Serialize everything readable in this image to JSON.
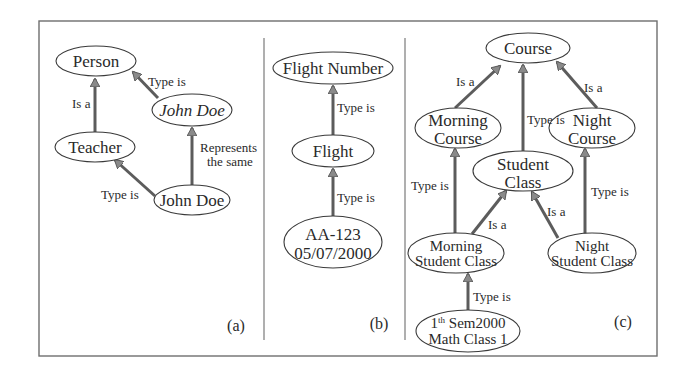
{
  "figure": {
    "panels": [
      {
        "id": "a",
        "tag": "(a)",
        "nodes": [
          {
            "id": "person",
            "label": "Person"
          },
          {
            "id": "john-doe-italic",
            "label": "John Doe",
            "italic": true
          },
          {
            "id": "teacher",
            "label": "Teacher"
          },
          {
            "id": "john-doe",
            "label": "John Doe"
          }
        ],
        "edges": [
          {
            "from": "john-doe-italic",
            "to": "person",
            "label": "Type is"
          },
          {
            "from": "teacher",
            "to": "person",
            "label": "Is a"
          },
          {
            "from": "john-doe",
            "to": "john-doe-italic",
            "label_lines": [
              "Represents",
              "the same"
            ]
          },
          {
            "from": "john-doe",
            "to": "teacher",
            "label": "Type is"
          }
        ]
      },
      {
        "id": "b",
        "tag": "(b)",
        "nodes": [
          {
            "id": "flight-number",
            "label": "Flight Number"
          },
          {
            "id": "flight",
            "label": "Flight"
          },
          {
            "id": "aa-123",
            "label_lines": [
              "AA-123",
              "05/07/2000"
            ]
          }
        ],
        "edges": [
          {
            "from": "flight",
            "to": "flight-number",
            "label": "Type is"
          },
          {
            "from": "aa-123",
            "to": "flight",
            "label": "Type is"
          }
        ]
      },
      {
        "id": "c",
        "tag": "(c)",
        "nodes": [
          {
            "id": "course",
            "label": "Course"
          },
          {
            "id": "morning-course",
            "label_lines": [
              "Morning",
              "Course"
            ]
          },
          {
            "id": "night-course",
            "label_lines": [
              "Night",
              "Course"
            ]
          },
          {
            "id": "student-class",
            "label_lines": [
              "Student",
              "Class"
            ]
          },
          {
            "id": "morning-student-class",
            "label_lines": [
              "Morning",
              "Student Class"
            ]
          },
          {
            "id": "night-student-class",
            "label_lines": [
              "Night",
              "Student Class"
            ]
          },
          {
            "id": "math-class",
            "label_lines": [
              "1",
              "th",
              " Sem2000",
              "Math Class 1"
            ]
          }
        ],
        "edges": [
          {
            "from": "morning-course",
            "to": "course",
            "label": "Is a"
          },
          {
            "from": "student-class",
            "to": "course",
            "label": "Type is"
          },
          {
            "from": "night-course",
            "to": "course",
            "label": "Is a"
          },
          {
            "from": "morning-student-class",
            "to": "morning-course",
            "label": "Type is"
          },
          {
            "from": "morning-student-class",
            "to": "student-class",
            "label": "Is a"
          },
          {
            "from": "night-student-class",
            "to": "student-class",
            "label": "Is a"
          },
          {
            "from": "night-student-class",
            "to": "night-course",
            "label": "Type is"
          },
          {
            "from": "math-class",
            "to": "morning-student-class",
            "label": "Type is"
          }
        ]
      }
    ]
  }
}
